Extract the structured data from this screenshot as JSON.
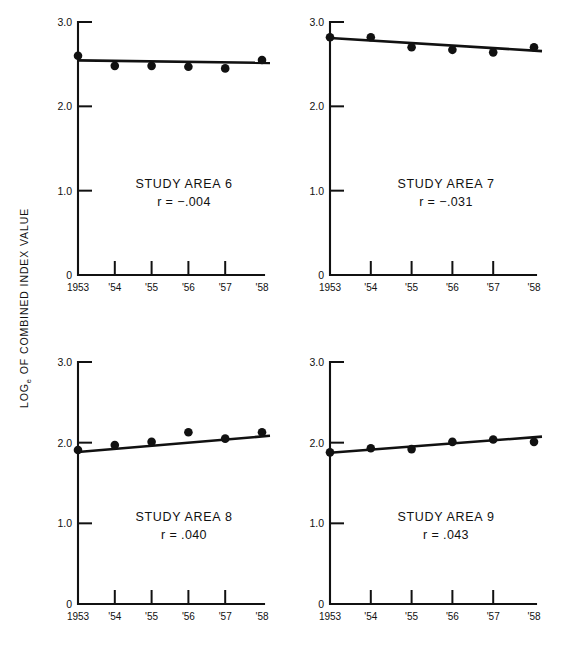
{
  "figure": {
    "y_axis_label_main": "OF COMBINED INDEX VALUE",
    "y_axis_label_prefix": "LOG",
    "y_axis_label_sub": "e",
    "width": 566,
    "height": 656
  },
  "chart_data": {
    "type": "scatter",
    "title": "",
    "xlabel": "",
    "ylabel": "LOGe OF COMBINED INDEX VALUE",
    "x": [
      1953,
      1954,
      1955,
      1956,
      1957,
      1958
    ],
    "xticklabels": [
      "1953",
      "'54",
      "'55",
      "'56",
      "'57",
      "'58"
    ],
    "yticks": [
      0,
      1.0,
      2.0,
      3.0
    ],
    "yticklabels": [
      "0",
      "1.0",
      "2.0",
      "3.0"
    ],
    "ylim": [
      0,
      3.1
    ],
    "xlim": [
      1953,
      1958
    ],
    "grid": false,
    "legend": "none",
    "panels": [
      {
        "id": "study-area-6",
        "title": "STUDY AREA 6",
        "annotation": "r = −.004",
        "r_value": -0.004,
        "values": [
          2.6,
          2.48,
          2.48,
          2.47,
          2.45,
          2.55
        ],
        "fit_start": 2.545,
        "fit_end": 2.515
      },
      {
        "id": "study-area-7",
        "title": "STUDY AREA 7",
        "annotation": "r = −.031",
        "r_value": -0.031,
        "values": [
          2.82,
          2.82,
          2.7,
          2.67,
          2.64,
          2.7
        ],
        "fit_start": 2.81,
        "fit_end": 2.655
      },
      {
        "id": "study-area-8",
        "title": "STUDY AREA 8",
        "annotation": "r = .040",
        "r_value": 0.04,
        "values": [
          1.91,
          1.97,
          2.01,
          2.13,
          2.05,
          2.13
        ],
        "fit_start": 1.885,
        "fit_end": 2.085
      },
      {
        "id": "study-area-9",
        "title": "STUDY AREA 9",
        "annotation": "r = .043",
        "r_value": 0.043,
        "values": [
          1.88,
          1.93,
          1.92,
          2.01,
          2.04,
          2.01
        ],
        "fit_start": 1.875,
        "fit_end": 2.075
      }
    ]
  }
}
